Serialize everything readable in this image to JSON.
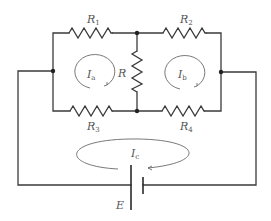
{
  "diagram": {
    "type": "electrical-circuit",
    "colors": {
      "wire": "#3a3a3a",
      "loop_arrow": "#6a6a6a",
      "label": "#555555",
      "background": "#ffffff"
    },
    "resistors": [
      {
        "id": "R1",
        "label": "R",
        "subscript": "1",
        "position": "top-left"
      },
      {
        "id": "R2",
        "label": "R",
        "subscript": "2",
        "position": "top-right"
      },
      {
        "id": "R3",
        "label": "R",
        "subscript": "3",
        "position": "bottom-left"
      },
      {
        "id": "R4",
        "label": "R",
        "subscript": "4",
        "position": "bottom-right"
      },
      {
        "id": "R",
        "label": "R",
        "subscript": "",
        "position": "center-vertical"
      }
    ],
    "mesh_currents": [
      {
        "id": "Ia",
        "label": "I",
        "subscript": "a",
        "direction": "clockwise",
        "loop": "left"
      },
      {
        "id": "Ib",
        "label": "I",
        "subscript": "b",
        "direction": "clockwise",
        "loop": "right"
      },
      {
        "id": "Ic",
        "label": "I",
        "subscript": "c",
        "direction": "counter-clockwise",
        "loop": "outer"
      }
    ],
    "source": {
      "id": "E",
      "label": "E",
      "type": "battery"
    },
    "nodes": [
      "left-junction",
      "right-junction",
      "top-center",
      "bottom-center"
    ]
  }
}
